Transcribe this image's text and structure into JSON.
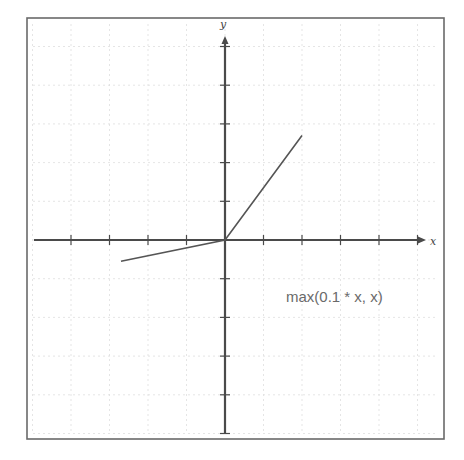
{
  "diagram": {
    "function_label": "max(0.1 * x, x)",
    "x_axis_label": "x",
    "y_axis_label": "y",
    "colors": {
      "frame": "#6a6a6a",
      "grid": "#dedede",
      "axis": "#4a4a4a",
      "curve": "#555555",
      "label": "#6a6a6a"
    }
  },
  "chart_data": {
    "type": "line",
    "title": "",
    "annotation": "max(0.1 * x, x)",
    "xlabel": "x",
    "ylabel": "y",
    "xlim": [
      -5,
      5
    ],
    "ylim": [
      -5,
      5
    ],
    "grid": true,
    "tick_spacing": 1,
    "series": [
      {
        "name": "max(0.1 * x, x)",
        "points": [
          [
            -2.7,
            -0.55
          ],
          [
            0,
            0
          ],
          [
            2,
            2.7
          ]
        ]
      }
    ]
  },
  "layout": {
    "frame": {
      "x": 27,
      "y": 18,
      "w": 417,
      "h": 421
    },
    "origin": {
      "x": 225,
      "y": 240
    },
    "unit_px": {
      "x": 38.5,
      "y": 38.7
    },
    "x_range_px": [
      34,
      420
    ],
    "y_range_px": [
      42,
      433
    ]
  }
}
